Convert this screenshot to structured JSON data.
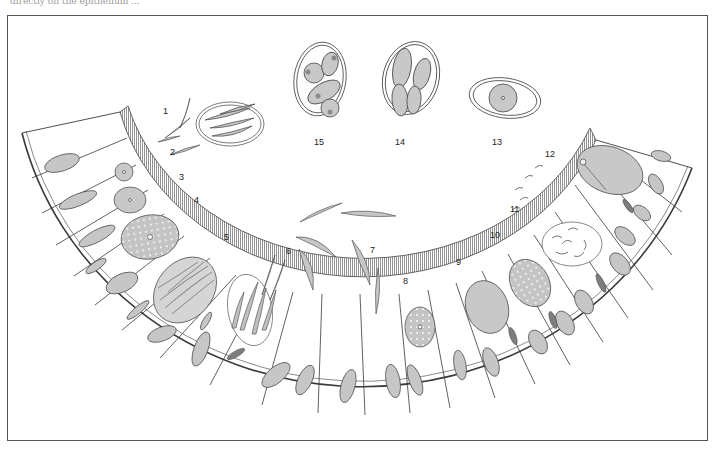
{
  "figure": {
    "title_fragment": "directly on the epithelium ... ",
    "stage_labels": [
      "1",
      "2",
      "3",
      "4",
      "5",
      "6",
      "7",
      "8",
      "9",
      "10",
      "11",
      "12",
      "13",
      "14",
      "15"
    ],
    "colors": {
      "line": "#3a3a3a",
      "cell_fill": "#ffffff",
      "nucleus_fill": "#c8c8c8",
      "parasite_fill": "#bdbdbd",
      "dark_nucleus": "#8a8a8a",
      "brush_border": "#8c8c8c",
      "frame": "#555555"
    }
  }
}
